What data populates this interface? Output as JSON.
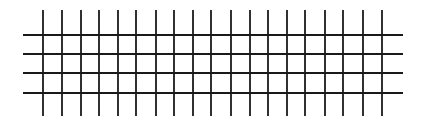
{
  "diagram": {
    "type": "grid",
    "background": "#ffffff",
    "line_color": "#1a1a1a",
    "line_width": 1.8,
    "vertical_lines": {
      "count": 19,
      "x": [
        43,
        62,
        81,
        99,
        118,
        136,
        156,
        174,
        193,
        211,
        231,
        250,
        268,
        287,
        305,
        325,
        343,
        363,
        382
      ],
      "y_start": 10,
      "y_end": 116
    },
    "horizontal_lines": {
      "count": 4,
      "y": [
        35,
        54,
        73,
        93
      ],
      "x_start": 23,
      "x_end": 403
    }
  }
}
